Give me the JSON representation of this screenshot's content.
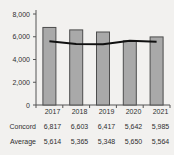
{
  "chart_data": {
    "type": "bar",
    "title": "",
    "subtitle": "",
    "xlabel": "",
    "ylabel": "",
    "categories": [
      "2017",
      "2018",
      "2019",
      "2020",
      "2021"
    ],
    "ylim": [
      0,
      8000
    ],
    "yticks": [
      0,
      2000,
      4000,
      6000,
      8000
    ],
    "ytick_labels": [
      "0",
      "2,000",
      "4,000",
      "6,000",
      "8,000"
    ],
    "grid": false,
    "legend_position": "none",
    "series": [
      {
        "name": "Concord",
        "type": "bar",
        "values": [
          6817,
          6603,
          6417,
          5642,
          5985
        ],
        "value_labels": [
          "6,817",
          "6,603",
          "6,417",
          "5,642",
          "5,985"
        ],
        "color": "#a9a9a9",
        "border_color": "#4d4d4d"
      },
      {
        "name": "Average",
        "type": "line",
        "values": [
          5614,
          5365,
          5348,
          5650,
          5564
        ],
        "value_labels": [
          "5,614",
          "5,365",
          "5,348",
          "5,650",
          "5,564"
        ],
        "color": "#111111"
      }
    ]
  },
  "table": {
    "rows": [
      {
        "label": "Concord",
        "values": [
          "6,817",
          "6,603",
          "6,417",
          "5,642",
          "5,985"
        ]
      },
      {
        "label": "Average",
        "values": [
          "5,614",
          "5,365",
          "5,348",
          "5,650",
          "5,564"
        ]
      }
    ]
  },
  "colors": {
    "background": "#f2f1ef",
    "bar_fill": "#a9a9a9",
    "bar_border": "#4d4d4d",
    "line": "#111111",
    "axis": "#555555",
    "text": "#2f2f2f"
  }
}
